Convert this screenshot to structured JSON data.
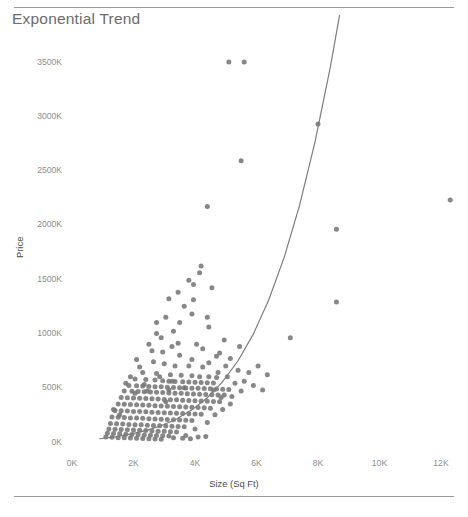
{
  "chart_data": {
    "type": "scatter",
    "title": "Exponential Trend",
    "xlabel": "Size (Sq Ft)",
    "ylabel": "Price",
    "xlim": [
      0,
      13000
    ],
    "ylim": [
      0,
      3700
    ],
    "xticks": [
      0,
      2000,
      4000,
      6000,
      8000,
      10000,
      12000
    ],
    "xtick_labels": [
      "0K",
      "2K",
      "4K",
      "6K",
      "8K",
      "10K",
      "12K"
    ],
    "yticks": [
      0,
      500,
      1000,
      1500,
      2000,
      2500,
      3000,
      3500
    ],
    "ytick_labels": [
      "0K",
      "500K",
      "1000K",
      "1500K",
      "2000K",
      "2500K",
      "3000K",
      "3500K"
    ],
    "grid": false,
    "legend": null,
    "marker_color": "#767676",
    "marker_size": 5,
    "trend": {
      "name": "Exponential Trend",
      "color": "#7d7d7d",
      "width": 1.2,
      "model": "exponential",
      "points": [
        [
          900,
          30
        ],
        [
          1400,
          48
        ],
        [
          1900,
          72
        ],
        [
          2400,
          105
        ],
        [
          2900,
          150
        ],
        [
          3400,
          212
        ],
        [
          3900,
          296
        ],
        [
          4400,
          408
        ],
        [
          4900,
          556
        ],
        [
          5400,
          748
        ],
        [
          5900,
          996
        ],
        [
          6400,
          1310
        ],
        [
          6900,
          1700
        ],
        [
          7400,
          2180
        ],
        [
          7900,
          2760
        ],
        [
          8400,
          3450
        ],
        [
          8700,
          3930
        ]
      ]
    },
    "points": [
      [
        5100,
        3500
      ],
      [
        5600,
        3500
      ],
      [
        8000,
        2930
      ],
      [
        5500,
        2590
      ],
      [
        8600,
        1960
      ],
      [
        12300,
        2230
      ],
      [
        4400,
        2170
      ],
      [
        4200,
        1620
      ],
      [
        3950,
        1450
      ],
      [
        4550,
        1420
      ],
      [
        8600,
        1290
      ],
      [
        3950,
        1310
      ],
      [
        3650,
        1250
      ],
      [
        3900,
        1180
      ],
      [
        4400,
        1150
      ],
      [
        4450,
        1060
      ],
      [
        3500,
        1100
      ],
      [
        7100,
        960
      ],
      [
        4050,
        900
      ],
      [
        3250,
        880
      ],
      [
        2950,
        830
      ],
      [
        3500,
        800
      ],
      [
        4700,
        790
      ],
      [
        5150,
        770
      ],
      [
        2650,
        740
      ],
      [
        3000,
        720
      ],
      [
        3800,
        700
      ],
      [
        4250,
        690
      ],
      [
        5000,
        700
      ],
      [
        5400,
        660
      ],
      [
        2300,
        640
      ],
      [
        2750,
        630
      ],
      [
        3200,
        620
      ],
      [
        3550,
        615
      ],
      [
        3900,
        610
      ],
      [
        4150,
        600
      ],
      [
        4450,
        600
      ],
      [
        4700,
        595
      ],
      [
        2050,
        580
      ],
      [
        2400,
        575
      ],
      [
        2700,
        570
      ],
      [
        2950,
        565
      ],
      [
        3150,
        560
      ],
      [
        3350,
        558
      ],
      [
        3600,
        555
      ],
      [
        3800,
        552
      ],
      [
        4000,
        550
      ],
      [
        4200,
        548
      ],
      [
        4400,
        545
      ],
      [
        4600,
        543
      ],
      [
        1850,
        520
      ],
      [
        2100,
        518
      ],
      [
        2300,
        515
      ],
      [
        2500,
        512
      ],
      [
        2700,
        510
      ],
      [
        2900,
        508
      ],
      [
        3100,
        505
      ],
      [
        3300,
        503
      ],
      [
        3500,
        500
      ],
      [
        3700,
        498
      ],
      [
        3900,
        496
      ],
      [
        4100,
        494
      ],
      [
        4300,
        492
      ],
      [
        4500,
        490
      ],
      [
        4700,
        488
      ],
      [
        4900,
        486
      ],
      [
        5100,
        484
      ],
      [
        1700,
        470
      ],
      [
        1950,
        468
      ],
      [
        2150,
        465
      ],
      [
        2350,
        462
      ],
      [
        2550,
        460
      ],
      [
        2750,
        458
      ],
      [
        2950,
        455
      ],
      [
        3150,
        452
      ],
      [
        3350,
        450
      ],
      [
        3550,
        448
      ],
      [
        3750,
        445
      ],
      [
        3950,
        443
      ],
      [
        4150,
        440
      ],
      [
        4350,
        438
      ],
      [
        4550,
        436
      ],
      [
        4750,
        434
      ],
      [
        4950,
        432
      ],
      [
        1600,
        410
      ],
      [
        1800,
        408
      ],
      [
        2000,
        405
      ],
      [
        2200,
        402
      ],
      [
        2400,
        400
      ],
      [
        2600,
        398
      ],
      [
        2800,
        395
      ],
      [
        3000,
        392
      ],
      [
        3200,
        390
      ],
      [
        3400,
        388
      ],
      [
        3600,
        385
      ],
      [
        3800,
        383
      ],
      [
        4000,
        380
      ],
      [
        4200,
        378
      ],
      [
        4400,
        375
      ],
      [
        4600,
        373
      ],
      [
        4800,
        370
      ],
      [
        1500,
        350
      ],
      [
        1700,
        348
      ],
      [
        1900,
        345
      ],
      [
        2100,
        342
      ],
      [
        2300,
        340
      ],
      [
        2500,
        338
      ],
      [
        2700,
        335
      ],
      [
        2900,
        332
      ],
      [
        3100,
        330
      ],
      [
        3300,
        328
      ],
      [
        3500,
        325
      ],
      [
        3700,
        322
      ],
      [
        3900,
        320
      ],
      [
        4100,
        318
      ],
      [
        4300,
        315
      ],
      [
        4500,
        312
      ],
      [
        1400,
        290
      ],
      [
        1600,
        288
      ],
      [
        1800,
        285
      ],
      [
        2000,
        282
      ],
      [
        2200,
        280
      ],
      [
        2400,
        278
      ],
      [
        2600,
        275
      ],
      [
        2800,
        272
      ],
      [
        3000,
        270
      ],
      [
        3200,
        268
      ],
      [
        3400,
        265
      ],
      [
        3600,
        262
      ],
      [
        3800,
        260
      ],
      [
        4000,
        258
      ],
      [
        4200,
        255
      ],
      [
        1300,
        230
      ],
      [
        1500,
        228
      ],
      [
        1700,
        225
      ],
      [
        1900,
        222
      ],
      [
        2100,
        220
      ],
      [
        2300,
        218
      ],
      [
        2500,
        215
      ],
      [
        2700,
        212
      ],
      [
        2900,
        210
      ],
      [
        3100,
        208
      ],
      [
        3300,
        205
      ],
      [
        3500,
        202
      ],
      [
        3700,
        200
      ],
      [
        3900,
        198
      ],
      [
        1250,
        170
      ],
      [
        1450,
        168
      ],
      [
        1650,
        165
      ],
      [
        1850,
        162
      ],
      [
        2050,
        160
      ],
      [
        2250,
        158
      ],
      [
        2450,
        155
      ],
      [
        2650,
        152
      ],
      [
        2850,
        150
      ],
      [
        3050,
        148
      ],
      [
        3250,
        145
      ],
      [
        3450,
        142
      ],
      [
        3650,
        140
      ],
      [
        1200,
        120
      ],
      [
        1400,
        118
      ],
      [
        1600,
        115
      ],
      [
        1800,
        112
      ],
      [
        2000,
        110
      ],
      [
        2200,
        108
      ],
      [
        2400,
        105
      ],
      [
        2600,
        102
      ],
      [
        2800,
        100
      ],
      [
        3000,
        98
      ],
      [
        3200,
        95
      ],
      [
        3400,
        92
      ],
      [
        1150,
        80
      ],
      [
        1350,
        78
      ],
      [
        1550,
        75
      ],
      [
        1750,
        72
      ],
      [
        1950,
        70
      ],
      [
        2150,
        68
      ],
      [
        2350,
        65
      ],
      [
        2550,
        62
      ],
      [
        2750,
        60
      ],
      [
        2950,
        58
      ],
      [
        3150,
        55
      ],
      [
        1100,
        45
      ],
      [
        1300,
        43
      ],
      [
        1500,
        40
      ],
      [
        1700,
        38
      ],
      [
        1900,
        36
      ],
      [
        2100,
        34
      ],
      [
        2300,
        32
      ],
      [
        2500,
        30
      ],
      [
        2700,
        28
      ],
      [
        2900,
        26
      ],
      [
        3300,
        40
      ],
      [
        3600,
        35
      ],
      [
        3850,
        30
      ],
      [
        4100,
        45
      ],
      [
        4350,
        50
      ],
      [
        2500,
        900
      ],
      [
        2900,
        960
      ],
      [
        3300,
        1020
      ],
      [
        3150,
        1320
      ],
      [
        3450,
        1380
      ],
      [
        4800,
        820
      ],
      [
        5300,
        540
      ],
      [
        5600,
        560
      ],
      [
        5900,
        520
      ],
      [
        6200,
        480
      ],
      [
        5200,
        420
      ],
      [
        4900,
        300
      ],
      [
        4650,
        250
      ],
      [
        4400,
        180
      ],
      [
        4000,
        120
      ],
      [
        3700,
        60
      ],
      [
        5450,
        880
      ],
      [
        6050,
        700
      ],
      [
        4150,
        1560
      ],
      [
        3800,
        1490
      ],
      [
        2200,
        690
      ],
      [
        1900,
        600
      ],
      [
        2600,
        840
      ],
      [
        3050,
        1150
      ],
      [
        2750,
        1000
      ],
      [
        5750,
        640
      ],
      [
        6350,
        620
      ],
      [
        4950,
        940
      ],
      [
        5500,
        470
      ],
      [
        4250,
        860
      ],
      [
        3350,
        700
      ],
      [
        2850,
        600
      ],
      [
        4750,
        640
      ],
      [
        5050,
        600
      ],
      [
        3150,
        480
      ],
      [
        2450,
        470
      ],
      [
        1750,
        540
      ],
      [
        2050,
        450
      ],
      [
        3050,
        370
      ],
      [
        3650,
        500
      ],
      [
        4450,
        730
      ],
      [
        3900,
        760
      ],
      [
        4600,
        480
      ],
      [
        3250,
        560
      ],
      [
        2350,
        530
      ],
      [
        1550,
        250
      ],
      [
        1350,
        300
      ],
      [
        4850,
        410
      ],
      [
        5150,
        350
      ],
      [
        3450,
        910
      ],
      [
        2100,
        760
      ],
      [
        2750,
        1100
      ]
    ]
  }
}
